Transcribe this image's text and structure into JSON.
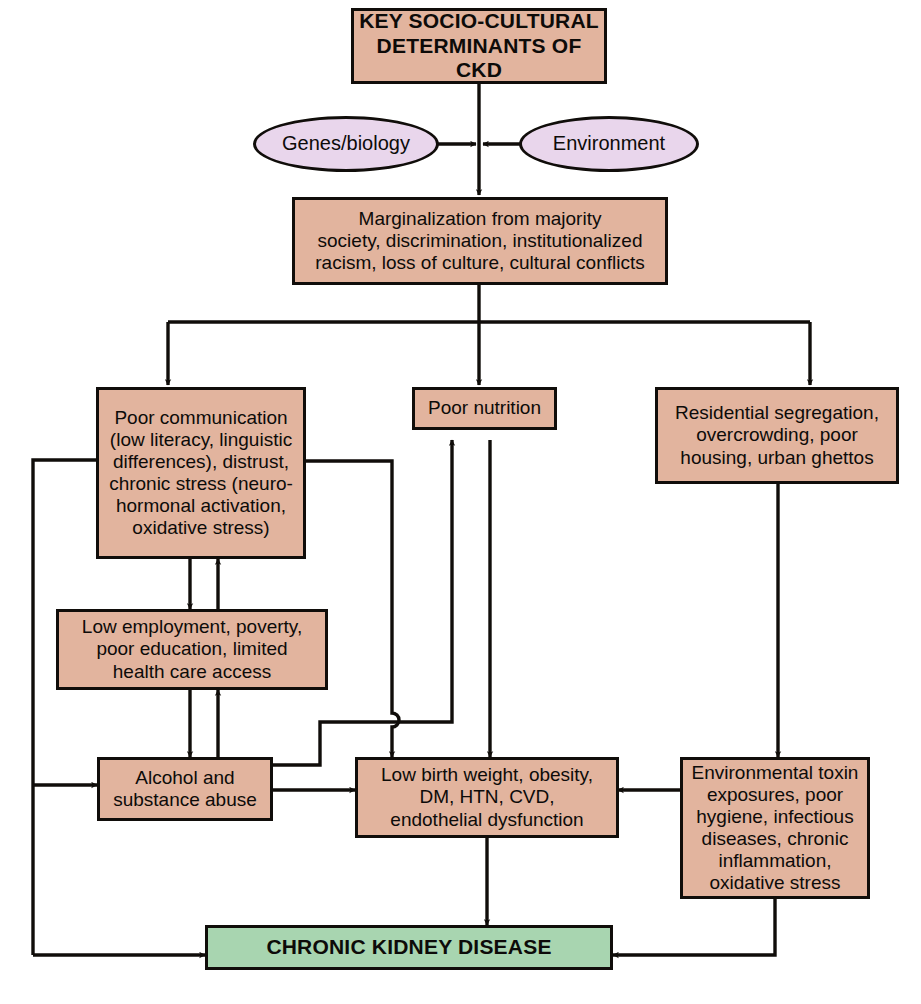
{
  "diagram": {
    "palette": {
      "box_fill": "#e2b49e",
      "ellipse_fill": "#e9d6ec",
      "outcome_fill": "#a8d5b0",
      "stroke": "#100d0a",
      "background": "#ffffff",
      "text": "#0d0b09"
    },
    "nodes": {
      "header": {
        "label": "KEY SOCIO-CULTURAL\nDETERMINANTS OF CKD"
      },
      "genes": {
        "label": "Genes/biology"
      },
      "environment": {
        "label": "Environment"
      },
      "marginalization": {
        "label": "Marginalization from majority\nsociety, discrimination, institutionalized\nracism, loss of culture, cultural conflicts"
      },
      "poor_communication": {
        "label": "Poor communication\n(low literacy, linguistic\ndifferences), distrust,\nchronic stress (neuro-\nhormonal activation,\noxidative stress)"
      },
      "poor_nutrition": {
        "label": "Poor nutrition"
      },
      "residential": {
        "label": "Residential segregation,\novercrowding, poor\nhousing, urban ghettos"
      },
      "low_employment": {
        "label": "Low employment, poverty,\npoor education, limited\nhealth care access"
      },
      "alcohol": {
        "label": "Alcohol and\nsubstance abuse"
      },
      "low_birth_weight": {
        "label": "Low birth weight, obesity,\nDM, HTN, CVD,\nendothelial dysfunction"
      },
      "environmental_toxin": {
        "label": "Environmental toxin\nexposures, poor\nhygiene, infectious\ndiseases, chronic\ninflammation,\noxidative stress"
      },
      "ckd": {
        "label": "CHRONIC KIDNEY DISEASE"
      }
    },
    "edges": [
      {
        "from": "header",
        "to": "marginalization",
        "kind": "arrow-down"
      },
      {
        "from": "genes",
        "to": "marginalization-trunk",
        "kind": "arrow-right"
      },
      {
        "from": "environment",
        "to": "marginalization-trunk",
        "kind": "arrow-left"
      },
      {
        "from": "marginalization",
        "to": "poor_communication",
        "kind": "arrow-down"
      },
      {
        "from": "marginalization",
        "to": "poor_nutrition",
        "kind": "arrow-down"
      },
      {
        "from": "marginalization",
        "to": "residential",
        "kind": "arrow-down"
      },
      {
        "from": "poor_communication",
        "to": "low_employment",
        "kind": "arrow-down"
      },
      {
        "from": "low_employment",
        "to": "poor_communication",
        "kind": "arrow-up"
      },
      {
        "from": "low_employment",
        "to": "alcohol",
        "kind": "arrow-down"
      },
      {
        "from": "alcohol",
        "to": "low_employment",
        "kind": "arrow-up"
      },
      {
        "from": "poor_communication",
        "to": "alcohol",
        "kind": "arrow-left-down"
      },
      {
        "from": "poor_communication",
        "to": "low_birth_weight",
        "kind": "arrow-right-down"
      },
      {
        "from": "poor_communication",
        "to": "ckd",
        "kind": "feedback-left"
      },
      {
        "from": "alcohol",
        "to": "low_birth_weight",
        "kind": "arrow-right"
      },
      {
        "from": "alcohol",
        "to": "poor_nutrition",
        "kind": "arrow-up-right"
      },
      {
        "from": "poor_nutrition",
        "to": "low_birth_weight",
        "kind": "arrow-down"
      },
      {
        "from": "residential",
        "to": "environmental_toxin",
        "kind": "arrow-down"
      },
      {
        "from": "environmental_toxin",
        "to": "low_birth_weight",
        "kind": "arrow-left"
      },
      {
        "from": "environmental_toxin",
        "to": "ckd",
        "kind": "arrow-down-left"
      },
      {
        "from": "low_birth_weight",
        "to": "ckd",
        "kind": "arrow-down"
      }
    ]
  }
}
